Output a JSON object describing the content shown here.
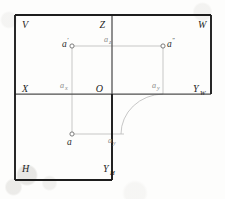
{
  "figure": {
    "type": "descriptive-geometry-three-plane-projection",
    "background_color": "#fdfdfc",
    "frame_color": "#1d1d1d",
    "axis_color": "#4a4a4a",
    "construction_color": "#b4b4b4",
    "label_color": "#2b2b2b",
    "minor_label_color": "#8a8a8a"
  },
  "planes": {
    "frontal": {
      "label": "V",
      "x": 22,
      "y": 26
    },
    "profile": {
      "label": "W",
      "x": 198,
      "y": 26
    },
    "horizontal": {
      "label": "H",
      "x": 22,
      "y": 170
    }
  },
  "axes": {
    "z": {
      "label": "Z",
      "x": 105,
      "y": 26
    },
    "x": {
      "label": "X",
      "x": 22,
      "y": 90
    },
    "y_w": {
      "label": "Y",
      "subscript": "W",
      "x": 193,
      "y": 90
    },
    "y_h": {
      "label": "Y",
      "subscript": "H",
      "x": 105,
      "y": 170
    },
    "origin": {
      "label": "O",
      "x": 103,
      "y": 90
    }
  },
  "points": [
    {
      "name": "a-front",
      "label": "a",
      "prime": "′",
      "x": 72,
      "y": 46,
      "label_x": 62,
      "label_y": 45
    },
    {
      "name": "a-profile",
      "label": "a",
      "prime": "″",
      "x": 163,
      "y": 46,
      "label_x": 168,
      "label_y": 45
    },
    {
      "name": "a-top",
      "label": "a",
      "prime": "",
      "x": 72,
      "y": 134,
      "label_x": 66,
      "label_y": 143
    }
  ],
  "trace_labels": [
    {
      "name": "a-z",
      "label": "a",
      "subscript": "z",
      "x": 107,
      "y": 40
    },
    {
      "name": "a-x",
      "label": "a",
      "subscript": "x",
      "x": 63,
      "y": 86
    },
    {
      "name": "a-y-w",
      "label": "a",
      "subscript": "y",
      "x": 155,
      "y": 86
    },
    {
      "name": "a-y-h",
      "label": "a",
      "subscript": "y",
      "x": 111,
      "y": 141
    }
  ],
  "geometry": {
    "frame_left": 15,
    "frame_right": 211,
    "frame_top": 15,
    "frame_bottom": 180,
    "v_panel_right": 112,
    "h_panel_right": 112,
    "ground_line_y": 94,
    "z_axis_x": 112,
    "arc_start_x": 163,
    "arc_start_y": 94,
    "arc_end_x": 120,
    "arc_end_y": 134
  }
}
